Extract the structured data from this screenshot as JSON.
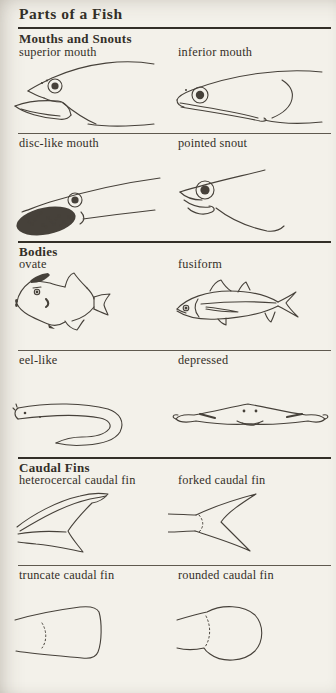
{
  "page": {
    "title": "Parts of a Fish"
  },
  "colors": {
    "background": "#f3f1ea",
    "ink": "#46413a",
    "text": "#332f28",
    "rule_heavy": "#332f28",
    "rule_light": "#5f594f"
  },
  "sections": [
    {
      "title": "Mouths and Snouts",
      "rows": [
        {
          "items": [
            {
              "label": "superior mouth",
              "figure": "superior-mouth"
            },
            {
              "label": "inferior mouth",
              "figure": "inferior-mouth"
            }
          ]
        },
        {
          "items": [
            {
              "label": "disc-like mouth",
              "figure": "disc-like-mouth"
            },
            {
              "label": "pointed snout",
              "figure": "pointed-snout"
            }
          ]
        }
      ]
    },
    {
      "title": "Bodies",
      "rows": [
        {
          "items": [
            {
              "label": "ovate",
              "figure": "ovate-body"
            },
            {
              "label": "fusiform",
              "figure": "fusiform-body"
            }
          ]
        },
        {
          "items": [
            {
              "label": "eel-like",
              "figure": "eel-like-body"
            },
            {
              "label": "depressed",
              "figure": "depressed-body"
            }
          ]
        }
      ]
    },
    {
      "title": "Caudal Fins",
      "rows": [
        {
          "items": [
            {
              "label": "heterocercal caudal fin",
              "figure": "heterocercal-caudal-fin"
            },
            {
              "label": "forked caudal fin",
              "figure": "forked-caudal-fin"
            }
          ]
        },
        {
          "items": [
            {
              "label": "truncate caudal fin",
              "figure": "truncate-caudal-fin"
            },
            {
              "label": "rounded caudal fin",
              "figure": "rounded-caudal-fin"
            }
          ]
        }
      ]
    }
  ]
}
